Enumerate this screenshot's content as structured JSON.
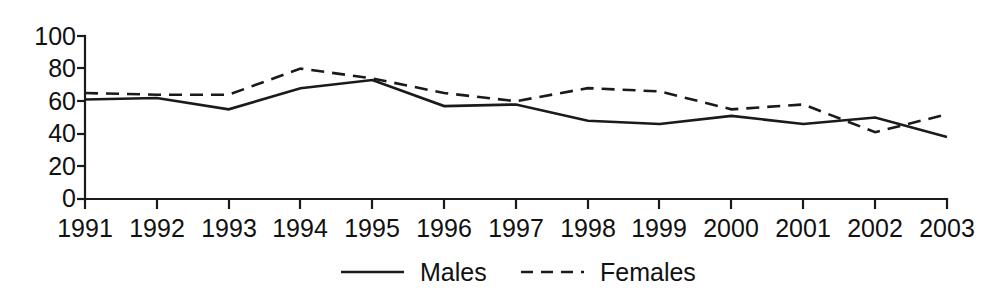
{
  "chart_data": {
    "type": "line",
    "title": "",
    "subtitle": "",
    "xlabel": "",
    "ylabel": "",
    "categories": [
      "1991",
      "1992",
      "1993",
      "1994",
      "1995",
      "1996",
      "1997",
      "1998",
      "1999",
      "2000",
      "2001",
      "2002",
      "2003"
    ],
    "x": [
      1991,
      1992,
      1993,
      1994,
      1995,
      1996,
      1997,
      1998,
      1999,
      2000,
      2001,
      2002,
      2003
    ],
    "series": [
      {
        "name": "Males",
        "style": "solid",
        "color": "#1a1a1a",
        "values": [
          61,
          62,
          55,
          68,
          73,
          57,
          58,
          48,
          46,
          51,
          46,
          50,
          38
        ]
      },
      {
        "name": "Females",
        "style": "dashed",
        "color": "#1a1a1a",
        "values": [
          65,
          64,
          64,
          80,
          74,
          65,
          60,
          68,
          66,
          55,
          58,
          41,
          52
        ]
      }
    ],
    "ylim": [
      0,
      100
    ],
    "ytick_values": [
      0,
      20,
      40,
      60,
      80,
      100
    ],
    "ytick_labels": [
      "0",
      "20",
      "40",
      "60",
      "80",
      "100"
    ],
    "xtick_labels": [
      "1991",
      "1992",
      "1993",
      "1994",
      "1995",
      "1996",
      "1997",
      "1998",
      "1999",
      "2000",
      "2001",
      "2002",
      "2003"
    ],
    "grid": false,
    "legend_position": "bottom-center",
    "legend": [
      {
        "label": "Males",
        "style": "solid"
      },
      {
        "label": "Females",
        "style": "dashed"
      }
    ]
  },
  "legend": {
    "males_label": "Males",
    "females_label": "Females"
  },
  "axes": {
    "y_labels": [
      "100",
      "80",
      "60",
      "40",
      "20",
      "0"
    ],
    "x_labels": [
      "1991",
      "1992",
      "1993",
      "1994",
      "1995",
      "1996",
      "1997",
      "1998",
      "1999",
      "2000",
      "2001",
      "2002",
      "2003"
    ]
  }
}
